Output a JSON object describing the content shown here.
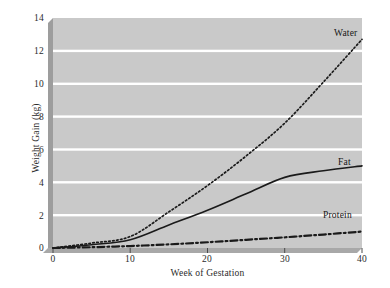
{
  "chart_data": {
    "type": "line",
    "title": "",
    "xlabel": "Week of Gestation",
    "ylabel": "Weight Gain (kg)",
    "xlim": [
      0,
      40
    ],
    "ylim": [
      0,
      14
    ],
    "xticks": [
      "0",
      "10",
      "20",
      "30",
      "40"
    ],
    "yticks": [
      "0",
      "2",
      "4",
      "6",
      "8",
      "10",
      "12",
      "14"
    ],
    "grid": "horizontal-white-gridlines",
    "legend_position": "inline-right-of-each-series",
    "plot_background": "#c9c9c9",
    "series": [
      {
        "name": "Water",
        "style": "dotted",
        "color": "#1a1a1a",
        "x": [
          0,
          5,
          10,
          15,
          20,
          25,
          30,
          35,
          40
        ],
        "values": [
          0,
          0.3,
          0.7,
          2.2,
          3.8,
          5.6,
          7.6,
          10.1,
          12.7
        ]
      },
      {
        "name": "Fat",
        "style": "solid",
        "color": "#1a1a1a",
        "x": [
          0,
          5,
          10,
          15,
          20,
          25,
          30,
          35,
          40
        ],
        "values": [
          0,
          0.2,
          0.5,
          1.4,
          2.3,
          3.3,
          4.3,
          4.7,
          5.0
        ]
      },
      {
        "name": "Protein",
        "style": "dash-dot",
        "color": "#1a1a1a",
        "x": [
          0,
          5,
          10,
          15,
          20,
          25,
          30,
          35,
          40
        ],
        "values": [
          0,
          0.05,
          0.12,
          0.22,
          0.35,
          0.5,
          0.65,
          0.82,
          1.0
        ]
      }
    ],
    "annotations": [
      {
        "text": "Water",
        "x": 36.5,
        "y": 13.4
      },
      {
        "text": "Fat",
        "x": 37.0,
        "y": 5.8
      },
      {
        "text": "Protein",
        "x": 35.2,
        "y": 1.85
      }
    ]
  }
}
